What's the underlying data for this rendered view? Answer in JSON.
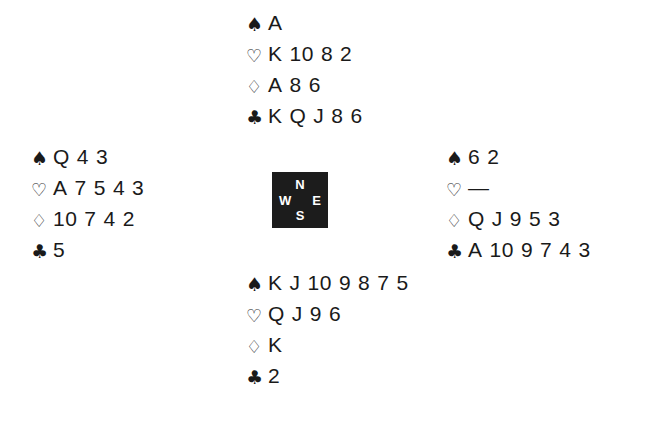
{
  "diagram": {
    "type": "bridge-deal-diagram",
    "background_color": "#ffffff",
    "ink_color": "#1a1a1a",
    "suit_glyphs": {
      "spade": "♠",
      "heart": "♡",
      "diamond": "♢",
      "club": "♣"
    },
    "void_marker": "—"
  },
  "compass": {
    "box_color": "#1c1c1c",
    "letter_color": "#ffffff",
    "north": "N",
    "west": "W",
    "east": "E",
    "south": "S"
  },
  "hands": {
    "north": {
      "position": "North",
      "suits": [
        {
          "suit": "spade",
          "glyph": "♠",
          "filled": true,
          "cards": [
            "A"
          ]
        },
        {
          "suit": "heart",
          "glyph": "♡",
          "filled": false,
          "cards": [
            "K",
            "10",
            "8",
            "2"
          ]
        },
        {
          "suit": "diamond",
          "glyph": "♢",
          "filled": false,
          "cards": [
            "A",
            "8",
            "6"
          ]
        },
        {
          "suit": "club",
          "glyph": "♣",
          "filled": true,
          "cards": [
            "K",
            "Q",
            "J",
            "8",
            "6"
          ]
        }
      ]
    },
    "west": {
      "position": "West",
      "suits": [
        {
          "suit": "spade",
          "glyph": "♠",
          "filled": true,
          "cards": [
            "Q",
            "4",
            "3"
          ]
        },
        {
          "suit": "heart",
          "glyph": "♡",
          "filled": false,
          "cards": [
            "A",
            "7",
            "5",
            "4",
            "3"
          ]
        },
        {
          "suit": "diamond",
          "glyph": "♢",
          "filled": false,
          "cards": [
            "10",
            "7",
            "4",
            "2"
          ]
        },
        {
          "suit": "club",
          "glyph": "♣",
          "filled": true,
          "cards": [
            "5"
          ]
        }
      ]
    },
    "east": {
      "position": "East",
      "suits": [
        {
          "suit": "spade",
          "glyph": "♠",
          "filled": true,
          "cards": [
            "6",
            "2"
          ]
        },
        {
          "suit": "heart",
          "glyph": "♡",
          "filled": false,
          "cards": [
            "—"
          ]
        },
        {
          "suit": "diamond",
          "glyph": "♢",
          "filled": false,
          "cards": [
            "Q",
            "J",
            "9",
            "5",
            "3"
          ]
        },
        {
          "suit": "club",
          "glyph": "♣",
          "filled": true,
          "cards": [
            "A",
            "10",
            "9",
            "7",
            "4",
            "3"
          ]
        }
      ]
    },
    "south": {
      "position": "South",
      "suits": [
        {
          "suit": "spade",
          "glyph": "♠",
          "filled": true,
          "cards": [
            "K",
            "J",
            "10",
            "9",
            "8",
            "7",
            "5"
          ]
        },
        {
          "suit": "heart",
          "glyph": "♡",
          "filled": false,
          "cards": [
            "Q",
            "J",
            "9",
            "6"
          ]
        },
        {
          "suit": "diamond",
          "glyph": "♢",
          "filled": false,
          "cards": [
            "K"
          ]
        },
        {
          "suit": "club",
          "glyph": "♣",
          "filled": true,
          "cards": [
            "2"
          ]
        }
      ]
    }
  }
}
